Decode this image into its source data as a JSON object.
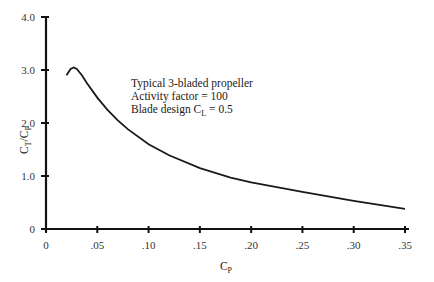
{
  "chart_data": {
    "type": "line",
    "title": "",
    "xlabel": "C_P",
    "ylabel": "C_T/C_P",
    "xlim": [
      0,
      0.35
    ],
    "ylim": [
      0,
      4.0
    ],
    "grid": false,
    "legend": null,
    "x_ticks": [
      "0",
      ".05",
      ".10",
      ".15",
      ".20",
      ".25",
      ".30",
      ".35"
    ],
    "y_ticks": [
      "0",
      "1.0",
      "2.0",
      "3.0",
      "4.0"
    ],
    "series": [
      {
        "name": "Typical 3-bladed propeller",
        "x": [
          0.02,
          0.024,
          0.027,
          0.03,
          0.035,
          0.04,
          0.05,
          0.06,
          0.07,
          0.08,
          0.1,
          0.12,
          0.15,
          0.18,
          0.2,
          0.25,
          0.3,
          0.35
        ],
        "y": [
          2.9,
          3.02,
          3.05,
          3.02,
          2.9,
          2.75,
          2.48,
          2.25,
          2.05,
          1.88,
          1.6,
          1.39,
          1.15,
          0.97,
          0.88,
          0.7,
          0.53,
          0.38
        ]
      }
    ],
    "annotations": [
      "Typical 3-bladed propeller",
      "Activity factor = 100",
      "Blade design C_L = 0.5"
    ]
  },
  "labels": {
    "y_axis_main": "C",
    "y_axis_sub1": "T",
    "y_axis_slash": "/C",
    "y_axis_sub2": "P",
    "x_axis_main": "C",
    "x_axis_sub": "P",
    "annot_line1": "Typical 3-bladed propeller",
    "annot_line2": "Activity factor = 100",
    "annot_line3_main": "Blade design C",
    "annot_line3_sub": "L",
    "annot_line3_rest": " = 0.5"
  }
}
